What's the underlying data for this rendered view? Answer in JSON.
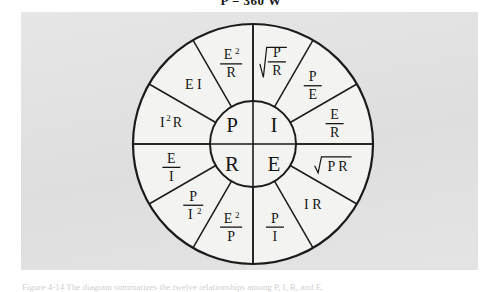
{
  "figure": {
    "header_equation": "P = 360 W",
    "caption": "Figure 4-14  The diagram summarizes the twelve relationships among P, I, R, and E.",
    "panel_color": "#e2e2e2",
    "line_color": "#1b1b1b",
    "face_color": "#f3f3f1"
  },
  "wheel": {
    "center": {
      "x": 253,
      "y": 144
    },
    "outer_radius": 120,
    "inner_radius": 43,
    "sector_count": 12,
    "sector_span_degrees": 30,
    "hub": {
      "quadrants": [
        {
          "id": "power",
          "symbol": "P",
          "position": "top-left"
        },
        {
          "id": "current",
          "symbol": "I",
          "position": "top-right"
        },
        {
          "id": "resistance",
          "symbol": "R",
          "position": "bottom-left"
        },
        {
          "id": "voltage",
          "symbol": "E",
          "position": "bottom-right"
        }
      ]
    },
    "sectors": [
      {
        "index": 0,
        "quadrant": "current",
        "angle_start_deg": -90,
        "angle_end_deg": -60,
        "kind": "radical-fraction",
        "numerator": "P",
        "denominator": "R",
        "text": "sqrt(P/R)",
        "name": "sector-sqrt-p-over-r"
      },
      {
        "index": 1,
        "quadrant": "current",
        "angle_start_deg": -60,
        "angle_end_deg": -30,
        "kind": "fraction",
        "numerator": "P",
        "denominator": "E",
        "text": "P/E",
        "name": "sector-p-over-e"
      },
      {
        "index": 2,
        "quadrant": "current",
        "angle_start_deg": -30,
        "angle_end_deg": 0,
        "kind": "fraction",
        "numerator": "E",
        "denominator": "R",
        "text": "E/R",
        "name": "sector-e-over-r"
      },
      {
        "index": 3,
        "quadrant": "voltage",
        "angle_start_deg": 0,
        "angle_end_deg": 30,
        "kind": "radical-plain",
        "plain": "P R",
        "text": "sqrt(PR)",
        "name": "sector-sqrt-pr"
      },
      {
        "index": 4,
        "quadrant": "voltage",
        "angle_start_deg": 30,
        "angle_end_deg": 60,
        "kind": "plain",
        "plain": "I R",
        "text": "IR",
        "name": "sector-i-r"
      },
      {
        "index": 5,
        "quadrant": "voltage",
        "angle_start_deg": 60,
        "angle_end_deg": 90,
        "kind": "fraction",
        "numerator": "P",
        "denominator": "I",
        "text": "P/I",
        "name": "sector-p-over-i"
      },
      {
        "index": 6,
        "quadrant": "resistance",
        "angle_start_deg": 90,
        "angle_end_deg": 120,
        "kind": "fraction-sup-num",
        "numerator": "E",
        "numerator_sup": "2",
        "denominator": "P",
        "text": "E^2/P",
        "name": "sector-e2-over-p"
      },
      {
        "index": 7,
        "quadrant": "resistance",
        "angle_start_deg": 120,
        "angle_end_deg": 150,
        "kind": "fraction-sup-den",
        "numerator": "P",
        "denominator": "I",
        "denominator_sup": "2",
        "text": "P/I^2",
        "name": "sector-p-over-i2"
      },
      {
        "index": 8,
        "quadrant": "resistance",
        "angle_start_deg": 150,
        "angle_end_deg": 180,
        "kind": "fraction",
        "numerator": "E",
        "denominator": "I",
        "text": "E/I",
        "name": "sector-e-over-i"
      },
      {
        "index": 9,
        "quadrant": "power",
        "angle_start_deg": 180,
        "angle_end_deg": 210,
        "kind": "plain-sup",
        "plain": "I",
        "plain_sup": "2",
        "plain_tail": "R",
        "text": "I^2 R",
        "name": "sector-i2-r"
      },
      {
        "index": 10,
        "quadrant": "power",
        "angle_start_deg": 210,
        "angle_end_deg": 240,
        "kind": "plain",
        "plain": "E I",
        "text": "EI",
        "name": "sector-e-i"
      },
      {
        "index": 11,
        "quadrant": "power",
        "angle_start_deg": 240,
        "angle_end_deg": 270,
        "kind": "fraction-sup-num",
        "numerator": "E",
        "numerator_sup": "2",
        "denominator": "R",
        "text": "E^2/R",
        "name": "sector-e2-over-r"
      }
    ]
  }
}
